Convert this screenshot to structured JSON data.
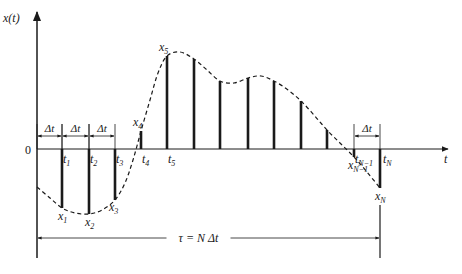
{
  "diagram": {
    "axes": {
      "y_label": "x(t)",
      "x_label": "t",
      "origin_label": "0"
    },
    "geometry": {
      "origin_x": 37,
      "baseline_y": 149,
      "y_axis_top": 12,
      "y_axis_bottom": 258,
      "x_axis_end": 448
    },
    "samples": [
      {
        "t_label": "t",
        "t_sub": "1",
        "x_label": "x",
        "x_sub": "1",
        "x": 62,
        "top": 208,
        "show_t": true,
        "show_x": true
      },
      {
        "t_label": "t",
        "t_sub": "2",
        "x_label": "x",
        "x_sub": "2",
        "x": 89,
        "top": 214,
        "show_t": true,
        "show_x": true
      },
      {
        "t_label": "t",
        "t_sub": "3",
        "x_label": "x",
        "x_sub": "3",
        "x": 115,
        "top": 200,
        "show_t": true,
        "show_x": true
      },
      {
        "t_label": "t",
        "t_sub": "4",
        "x_label": "x",
        "x_sub": "4",
        "x": 141,
        "top": 131,
        "show_t": true,
        "show_x": true
      },
      {
        "t_label": "t",
        "t_sub": "5",
        "x_label": "x",
        "x_sub": "5",
        "x": 167,
        "top": 56,
        "show_t": true,
        "show_x": true
      },
      {
        "x": 194,
        "top": 59
      },
      {
        "x": 220,
        "top": 81
      },
      {
        "x": 248,
        "top": 78
      },
      {
        "x": 274,
        "top": 81
      },
      {
        "x": 301,
        "top": 101
      },
      {
        "x": 327,
        "top": 130
      },
      {
        "t_label": "t",
        "t_sub": "N−1",
        "x_label": "x",
        "x_sub": "N−1",
        "x": 354,
        "top": 157,
        "show_t": true,
        "show_x": true
      },
      {
        "t_label": "t",
        "t_sub": "N",
        "x_label": "x",
        "x_sub": "N",
        "x": 380,
        "top": 188,
        "show_t": true,
        "show_x": true
      }
    ],
    "delta_labels": [
      {
        "text": "Δt",
        "from": 37,
        "to": 62,
        "y": 136
      },
      {
        "text": "Δt",
        "from": 62,
        "to": 89,
        "y": 136
      },
      {
        "text": "Δt",
        "from": 89,
        "to": 115,
        "y": 136
      },
      {
        "text": "Δt",
        "from": 354,
        "to": 380,
        "y": 136
      }
    ],
    "duration": {
      "label": "τ = N Δt",
      "from": 37,
      "to": 380,
      "y": 238
    },
    "curve_points": [
      [
        37,
        187
      ],
      [
        50,
        198
      ],
      [
        62,
        208
      ],
      [
        75,
        213
      ],
      [
        89,
        214
      ],
      [
        102,
        210
      ],
      [
        115,
        200
      ],
      [
        125,
        183
      ],
      [
        133,
        160
      ],
      [
        141,
        131
      ],
      [
        150,
        100
      ],
      [
        158,
        73
      ],
      [
        167,
        56
      ],
      [
        180,
        52
      ],
      [
        194,
        59
      ],
      [
        207,
        70
      ],
      [
        220,
        81
      ],
      [
        234,
        83
      ],
      [
        248,
        78
      ],
      [
        261,
        76
      ],
      [
        274,
        81
      ],
      [
        288,
        90
      ],
      [
        301,
        101
      ],
      [
        314,
        115
      ],
      [
        327,
        130
      ],
      [
        341,
        144
      ],
      [
        354,
        157
      ],
      [
        367,
        172
      ],
      [
        380,
        188
      ]
    ],
    "colors": {
      "ink": "#1a1a1a",
      "background": "#ffffff"
    }
  }
}
